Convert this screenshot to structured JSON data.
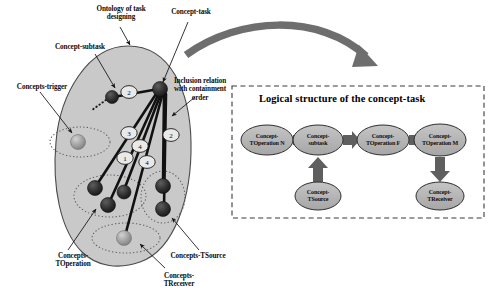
{
  "figure": {
    "background": "#ffffff",
    "ontology_fill": "#c9c9c9",
    "cluster_stroke": "#6b6b6b",
    "node_dark": "#2b2b2b",
    "node_light": "#9a9a9a",
    "arrow_gray": "#6e6e6e",
    "ellipse_fill": "#b4b4b4",
    "panel_border": "#3a3a3a"
  },
  "left_diagram": {
    "annotations": [
      {
        "id": "ontology",
        "text": "Ontology of task\ndesigning",
        "x": 78,
        "y": 5,
        "w": 86
      },
      {
        "id": "concept-task",
        "text": "Concept-task",
        "x": 160,
        "y": 8,
        "w": 62
      },
      {
        "id": "concept-subtask",
        "text": "Concept-subtask",
        "x": 42,
        "y": 43,
        "w": 76
      },
      {
        "id": "concepts-trigger",
        "text": "Concepts-trigger",
        "x": 6,
        "y": 83,
        "w": 72
      },
      {
        "id": "inclusion",
        "text": "Inclusion relation\nwith containment\norder",
        "x": 168,
        "y": 77,
        "w": 64
      },
      {
        "id": "concepts-toperation",
        "text": "Concepts-\nTOperation",
        "x": 42,
        "y": 252,
        "w": 62
      },
      {
        "id": "concepts-tsource",
        "text": "Concepts-TSource",
        "x": 160,
        "y": 252,
        "w": 76
      },
      {
        "id": "concepts-treceiver",
        "text": "Concepts-\nTReceiver",
        "x": 148,
        "y": 272,
        "w": 62
      }
    ],
    "relation_numbers": [
      {
        "label": "2",
        "cx": 129,
        "cy": 92
      },
      {
        "label": "3",
        "cx": 129,
        "cy": 133
      },
      {
        "label": "2",
        "cx": 171,
        "cy": 135
      },
      {
        "label": "4",
        "cx": 140,
        "cy": 146
      },
      {
        "label": "1",
        "cx": 125,
        "cy": 158
      },
      {
        "label": "4",
        "cx": 147,
        "cy": 162
      }
    ],
    "nodes": [
      {
        "id": "concept-task",
        "cx": 160,
        "cy": 89,
        "r": 7.5,
        "tone": "dark"
      },
      {
        "id": "concept-subtask",
        "cx": 112,
        "cy": 97,
        "r": 6.5,
        "tone": "dark"
      },
      {
        "id": "trigger-a",
        "cx": 78,
        "cy": 142,
        "r": 7.5,
        "tone": "light"
      },
      {
        "id": "toperation-a",
        "cx": 95,
        "cy": 188,
        "r": 7.5,
        "tone": "dark"
      },
      {
        "id": "toperation-b",
        "cx": 108,
        "cy": 205,
        "r": 7.5,
        "tone": "dark"
      },
      {
        "id": "toperation-c",
        "cx": 124,
        "cy": 192,
        "r": 7.0,
        "tone": "dark"
      },
      {
        "id": "tsource-a",
        "cx": 163,
        "cy": 186,
        "r": 7.5,
        "tone": "dark"
      },
      {
        "id": "tsource-b",
        "cx": 163,
        "cy": 209,
        "r": 7.5,
        "tone": "dark"
      },
      {
        "id": "treceiver-a",
        "cx": 124,
        "cy": 238,
        "r": 7.5,
        "tone": "light"
      }
    ]
  },
  "panel": {
    "title": "Logical structure of the concept-task",
    "flow_nodes": [
      {
        "id": "op-n",
        "text": "Concept-\nTOperation N",
        "cx": 267,
        "cy": 140,
        "rx": 26,
        "ry": 15
      },
      {
        "id": "subtask",
        "text": "Concept-\nsubtask",
        "cx": 318,
        "cy": 140,
        "rx": 25,
        "ry": 15
      },
      {
        "id": "op-f",
        "text": "Concept-\nTOperation F",
        "cx": 383,
        "cy": 140,
        "rx": 26,
        "ry": 15
      },
      {
        "id": "op-m",
        "text": "Concept-\nTOperation M",
        "cx": 440,
        "cy": 140,
        "rx": 26,
        "ry": 16
      },
      {
        "id": "tsource",
        "text": "Concept-\nTSource",
        "cx": 318,
        "cy": 196,
        "rx": 23,
        "ry": 14
      },
      {
        "id": "treceiver",
        "text": "Concept-\nTReceiver",
        "cx": 440,
        "cy": 196,
        "rx": 24,
        "ry": 14
      }
    ],
    "flow_arrows": [
      {
        "id": "op-n-to-subtask",
        "from": "op-n",
        "to": "subtask",
        "dir": "right"
      },
      {
        "id": "subtask-to-op-f",
        "from": "subtask",
        "to": "op-f",
        "dir": "right"
      },
      {
        "id": "op-f-to-op-m",
        "from": "op-f",
        "to": "op-m",
        "dir": "right"
      },
      {
        "id": "tsource-to-subtask",
        "from": "tsource",
        "to": "subtask",
        "dir": "up"
      },
      {
        "id": "op-m-to-treceiver",
        "from": "op-m",
        "to": "treceiver",
        "dir": "down"
      }
    ]
  }
}
